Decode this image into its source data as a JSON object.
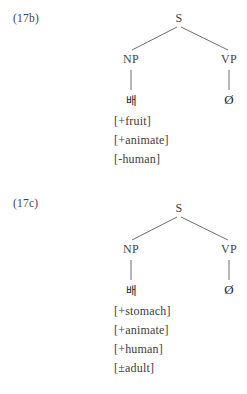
{
  "page": {
    "background_color": "#ffffff",
    "text_color": "#3b3b3b",
    "line_color": "#6e6e6e"
  },
  "figures": [
    {
      "id": "17b",
      "label": "(17b)",
      "tree": {
        "root": "S",
        "left_node": "NP",
        "right_node": "VP",
        "left_terminal": "배",
        "right_terminal": "Ø"
      },
      "features": [
        "[+fruit]",
        "[+animate]",
        "[-human]"
      ]
    },
    {
      "id": "17c",
      "label": "(17c)",
      "tree": {
        "root": "S",
        "left_node": "NP",
        "right_node": "VP",
        "left_terminal": "배",
        "right_terminal": "Ø"
      },
      "features": [
        "[+stomach]",
        "[+animate]",
        "[+human]",
        "[±adult]"
      ]
    }
  ]
}
